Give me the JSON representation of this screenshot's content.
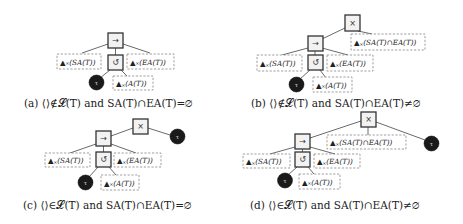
{
  "operators": {
    "sequence": "→",
    "loop": "↺",
    "xor": "×"
  },
  "tau_label": "τ",
  "labels": {
    "sa": {
      "prefix": "▲",
      "sub": "×",
      "text": "(SA(T))"
    },
    "ea": {
      "prefix": "▲",
      "sub": "×",
      "text": "(EA(T))"
    },
    "a": {
      "prefix": "▲",
      "sub": "×",
      "text": "(A(T))"
    },
    "sa_cap_ea": {
      "prefix": "▲",
      "sub": "×",
      "text": "(SA(T)∩EA(T))"
    }
  },
  "panels": [
    {
      "id": "a",
      "caption": "(a) ⟨⟩∉𝓛(T) and SA(T)∩EA(T)=∅"
    },
    {
      "id": "b",
      "caption": "(b) ⟨⟩∉𝓛(T) and SA(T)∩EA(T)≠∅"
    },
    {
      "id": "c",
      "caption": "(c) ⟨⟩∈𝓛(T) and SA(T)∩EA(T)=∅"
    },
    {
      "id": "d",
      "caption": "(d) ⟨⟩∈𝓛(T) and SA(T)∩EA(T)≠∅"
    }
  ]
}
